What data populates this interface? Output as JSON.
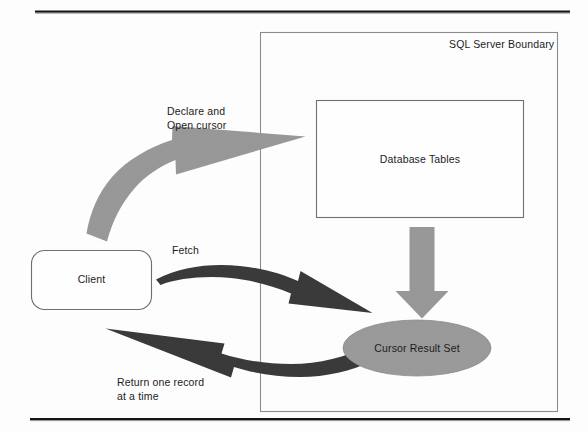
{
  "page": {
    "width": 588,
    "height": 431,
    "background": "#fefefe",
    "rule_color": "#111111"
  },
  "diagram": {
    "title_label": "SQL Server Boundary",
    "colors": {
      "gray_arrow": "#989898",
      "dark_arrow": "#3a3a3a",
      "ellipse_fill": "#9a9a9a",
      "box_stroke": "#6f6f6f",
      "boundary_stroke": "#8d8d8d",
      "text": "#1c1c1c"
    },
    "nodes": [
      {
        "id": "sql-server-boundary",
        "shape": "rectangle",
        "label": "SQL Server Boundary",
        "x": 260,
        "y": 32,
        "width": 298,
        "height": 380,
        "fill": "none",
        "label_align": "top-right"
      },
      {
        "id": "database-tables",
        "shape": "rectangle",
        "label": "Database Tables",
        "x": 316,
        "y": 100,
        "width": 208,
        "height": 118,
        "fill": "#ffffff"
      },
      {
        "id": "client",
        "shape": "rounded-rectangle",
        "label": "Client",
        "x": 31,
        "y": 250,
        "width": 121,
        "height": 60,
        "fill": "#ffffff"
      },
      {
        "id": "cursor-result-set",
        "shape": "ellipse",
        "label": "Cursor Result Set",
        "cx": 417,
        "cy": 348,
        "rx": 74,
        "ry": 28,
        "fill": "#9a9a9a"
      }
    ],
    "arrows": [
      {
        "id": "declare-open-cursor-arrow",
        "label": "Declare and\nOpen cursor",
        "label_lines": [
          "Declare and",
          "Open cursor"
        ],
        "from": "client",
        "to": "database-tables",
        "style": "curved-block",
        "color": "#989898",
        "direction": "up-right"
      },
      {
        "id": "fetch-arrow",
        "label": "Fetch",
        "label_lines": [
          "Fetch"
        ],
        "from": "client",
        "to": "cursor-result-set",
        "style": "curved-block",
        "color": "#3a3a3a",
        "direction": "right"
      },
      {
        "id": "return-record-arrow",
        "label": "Return one record\nat a time",
        "label_lines": [
          "Return one record",
          "at a time"
        ],
        "from": "cursor-result-set",
        "to": "client",
        "style": "curved-block",
        "color": "#3a3a3a",
        "direction": "left"
      },
      {
        "id": "tables-to-cursor-arrow",
        "label": "",
        "label_lines": [],
        "from": "database-tables",
        "to": "cursor-result-set",
        "style": "block",
        "color": "#989898",
        "direction": "down"
      }
    ],
    "labels": {
      "boundary": "SQL Server Boundary",
      "database_tables": "Database Tables",
      "client": "Client",
      "cursor_result_set": "Cursor Result Set",
      "declare_line1": "Declare and",
      "declare_line2": "Open cursor",
      "fetch": "Fetch",
      "return_line1": "Return one record",
      "return_line2": "at a time"
    }
  }
}
